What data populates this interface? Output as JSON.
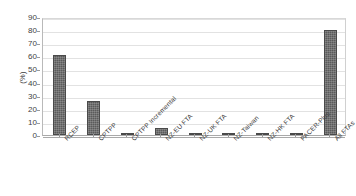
{
  "chart_data": {
    "type": "bar",
    "title": "",
    "xlabel": "",
    "ylabel": "(%)",
    "categories": [
      "RCEP",
      "CPTPP",
      "CPTPP Incremental",
      "NZ-EU FTA",
      "NZ-UK FTA",
      "NZ-Taiwan",
      "NZ-HK FTA",
      "PACER-Plus",
      "All FTAs"
    ],
    "values": [
      61,
      26,
      1.5,
      5,
      1.5,
      1.5,
      1.5,
      0.3,
      80
    ],
    "ylim": [
      0,
      90
    ],
    "ytick_step": 10,
    "yticks": [
      "0",
      "10",
      "20",
      "30",
      "40",
      "50",
      "60",
      "70",
      "80",
      "90"
    ],
    "grid": true,
    "legend": false,
    "bar_color": "#5a5a5a",
    "grid_color": "#e2e2e2",
    "axis_color": "#a9a9a9"
  }
}
